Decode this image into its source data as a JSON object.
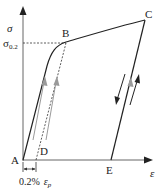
{
  "diagram": {
    "type": "stress-strain curve with unloading/reloading",
    "axes": {
      "y_label": "σ",
      "x_label": "ε",
      "y_marker_label": "σ",
      "y_marker_subscript": "0.2"
    },
    "points": {
      "A": "A",
      "B": "B",
      "C": "C",
      "D": "D",
      "E": "E"
    },
    "offset_annotation": {
      "percent": "0.2%",
      "symbol": "ε",
      "subscript": "p"
    },
    "colors": {
      "curve": "#222222",
      "axis": "#555555",
      "arrow_gray": "#9a9a9a",
      "dashed": "#333333"
    }
  }
}
